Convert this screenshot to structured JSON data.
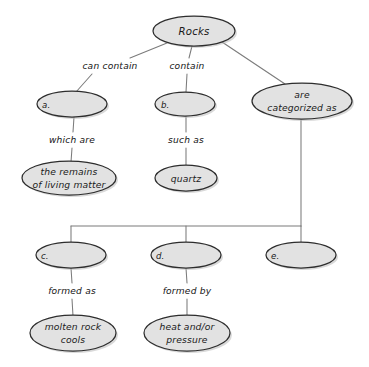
{
  "diagram": {
    "type": "concept-map",
    "background_color": "#ffffff",
    "node_fill_color": "#e2e2e2",
    "node_stroke_color": "#2d2d2d",
    "edge_color": "#7b7b7b",
    "text_color": "#1a1a1a",
    "nodes": [
      {
        "id": "rocks",
        "label": "Rocks",
        "lines": [
          "Rocks"
        ],
        "cx": 194,
        "cy": 31,
        "rx": 41,
        "ry": 15,
        "style": "title"
      },
      {
        "id": "a",
        "label": "a.",
        "lines": [
          "a."
        ],
        "cx": 72,
        "cy": 104,
        "rx": 35,
        "ry": 13,
        "style": "letter"
      },
      {
        "id": "b",
        "label": "b.",
        "lines": [
          "b."
        ],
        "cx": 185,
        "cy": 104,
        "rx": 30,
        "ry": 12,
        "style": "letter"
      },
      {
        "id": "categorized",
        "label": "are categorized as",
        "lines": [
          "are",
          "categorized as"
        ],
        "cx": 302,
        "cy": 101,
        "rx": 50,
        "ry": 18,
        "style": "normal"
      },
      {
        "id": "remains",
        "label": "the remains of living matter",
        "lines": [
          "the remains",
          "of living matter"
        ],
        "cx": 69,
        "cy": 178,
        "rx": 47,
        "ry": 17,
        "style": "normal"
      },
      {
        "id": "quartz",
        "label": "quartz",
        "lines": [
          "quartz"
        ],
        "cx": 186,
        "cy": 178,
        "rx": 31,
        "ry": 13,
        "style": "normal"
      },
      {
        "id": "c",
        "label": "c.",
        "lines": [
          "c."
        ],
        "cx": 71,
        "cy": 255,
        "rx": 35,
        "ry": 13,
        "style": "letter"
      },
      {
        "id": "d",
        "label": "d.",
        "lines": [
          "d."
        ],
        "cx": 186,
        "cy": 255,
        "rx": 35,
        "ry": 13,
        "style": "letter"
      },
      {
        "id": "e",
        "label": "e.",
        "lines": [
          "e."
        ],
        "cx": 301,
        "cy": 255,
        "rx": 35,
        "ry": 13,
        "style": "letter"
      },
      {
        "id": "molten",
        "label": "molten rock cools",
        "lines": [
          "molten rock",
          "cools"
        ],
        "cx": 73,
        "cy": 333,
        "rx": 43,
        "ry": 18,
        "style": "normal"
      },
      {
        "id": "heat",
        "label": "heat and/or pressure",
        "lines": [
          "heat and/or",
          "pressure"
        ],
        "cx": 187,
        "cy": 333,
        "rx": 43,
        "ry": 18,
        "style": "normal"
      }
    ],
    "edge_labels": [
      {
        "id": "can-contain",
        "text": "can contain",
        "x": 110,
        "y": 66
      },
      {
        "id": "contain",
        "text": "contain",
        "x": 187,
        "y": 66
      },
      {
        "id": "which-are",
        "text": "which are",
        "x": 72,
        "y": 140
      },
      {
        "id": "such-as",
        "text": "such as",
        "x": 186,
        "y": 140
      },
      {
        "id": "formed-as",
        "text": "formed as",
        "x": 72,
        "y": 291
      },
      {
        "id": "formed-by",
        "text": "formed by",
        "x": 187,
        "y": 291
      }
    ],
    "edges": [
      {
        "id": "rocks-to-a",
        "from": "rocks",
        "to": "a",
        "label": "can contain"
      },
      {
        "id": "rocks-to-b",
        "from": "rocks",
        "to": "b",
        "label": "contain"
      },
      {
        "id": "rocks-to-categorized",
        "from": "rocks",
        "to": "categorized",
        "label": ""
      },
      {
        "id": "a-to-remains",
        "from": "a",
        "to": "remains",
        "label": "which are"
      },
      {
        "id": "b-to-quartz",
        "from": "b",
        "to": "quartz",
        "label": "such as"
      },
      {
        "id": "categorized-to-c",
        "from": "categorized",
        "to": "c",
        "label": ""
      },
      {
        "id": "categorized-to-d",
        "from": "categorized",
        "to": "d",
        "label": ""
      },
      {
        "id": "categorized-to-e",
        "from": "categorized",
        "to": "e",
        "label": ""
      },
      {
        "id": "c-to-molten",
        "from": "c",
        "to": "molten",
        "label": "formed as"
      },
      {
        "id": "d-to-heat",
        "from": "d",
        "to": "heat",
        "label": "formed by"
      }
    ]
  }
}
